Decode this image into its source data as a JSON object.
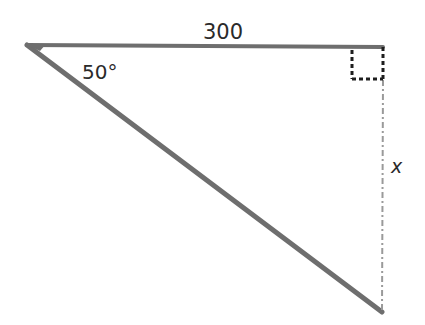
{
  "diagram": {
    "type": "right-triangle",
    "vertices": {
      "left": {
        "x": 27,
        "y": 45
      },
      "right_angle": {
        "x": 383,
        "y": 47
      },
      "bottom": {
        "x": 382,
        "y": 312
      }
    },
    "labels": {
      "top_side": "300",
      "angle_at_left": "50°",
      "right_side": "x"
    },
    "right_angle_marker": {
      "style": "dashed-square",
      "size": 31
    },
    "colors": {
      "solid_stroke": "#6e6e6e",
      "dashed_stroke": "#9a9a9a",
      "marker": "#1e1e1e",
      "text": "#2a2a2a"
    }
  }
}
